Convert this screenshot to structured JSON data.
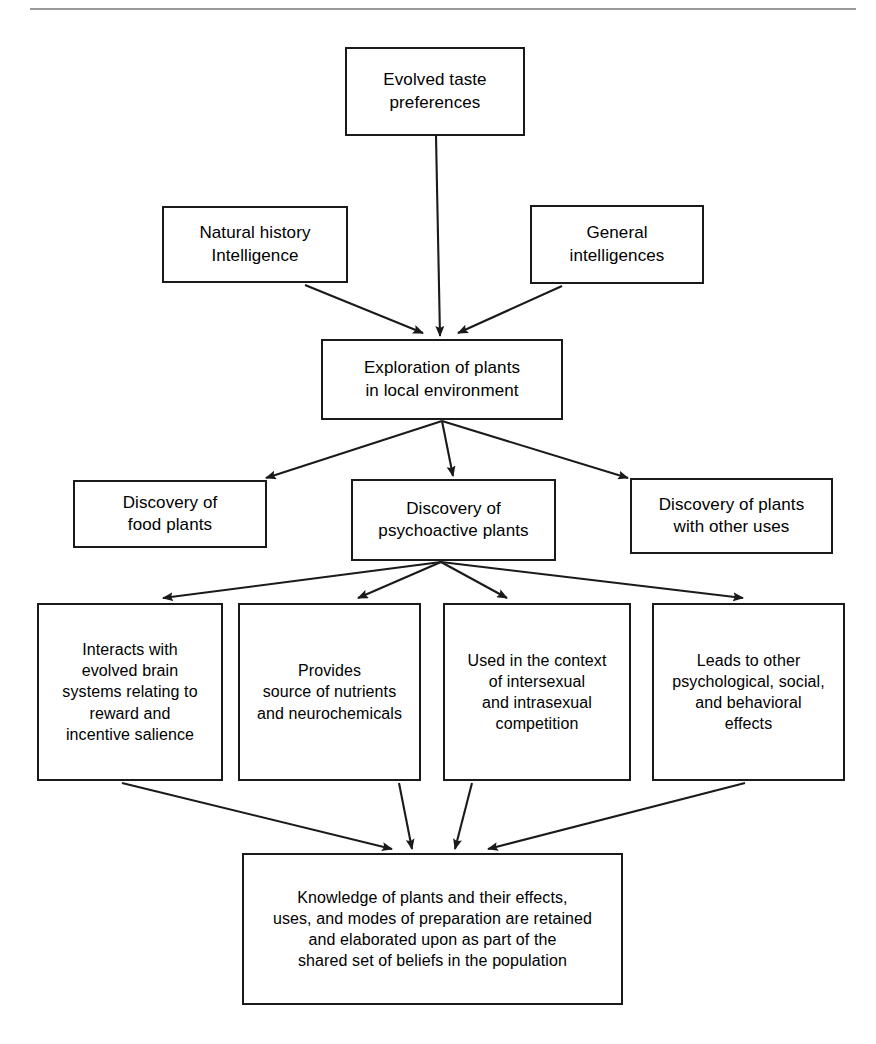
{
  "page": {
    "width": 876,
    "height": 1044,
    "background_color": "#ffffff",
    "line_color": "#1a1a1a",
    "top_rule_color": "#9a9a9a"
  },
  "diagram": {
    "type": "flowchart",
    "title": "",
    "nodes": [
      {
        "id": "evolved-taste-preferences",
        "label": "Evolved taste\npreferences",
        "x": 345,
        "y": 47,
        "w": 180,
        "h": 89,
        "font_size": 17
      },
      {
        "id": "natural-history-intelligence",
        "label": "Natural history\nIntelligence",
        "x": 162,
        "y": 206,
        "w": 186,
        "h": 77,
        "font_size": 17
      },
      {
        "id": "general-intelligences",
        "label": "General\nintelligences",
        "x": 530,
        "y": 205,
        "w": 174,
        "h": 79,
        "font_size": 17
      },
      {
        "id": "exploration-of-plants",
        "label": "Exploration of plants\nin local environment",
        "x": 321,
        "y": 339,
        "w": 242,
        "h": 81,
        "font_size": 17
      },
      {
        "id": "discovery-of-food-plants",
        "label": "Discovery of\nfood plants",
        "x": 73,
        "y": 480,
        "w": 194,
        "h": 68,
        "font_size": 17
      },
      {
        "id": "discovery-of-psychoactive-plants",
        "label": "Discovery of\npsychoactive plants",
        "x": 351,
        "y": 479,
        "w": 205,
        "h": 82,
        "font_size": 17
      },
      {
        "id": "discovery-of-plants-other-uses",
        "label": "Discovery of plants\nwith other uses",
        "x": 630,
        "y": 478,
        "w": 203,
        "h": 76,
        "font_size": 17
      },
      {
        "id": "interacts-with-evolved-brain-systems",
        "label": "Interacts with\nevolved brain\nsystems relating to\nreward and\nincentive salience",
        "x": 37,
        "y": 603,
        "w": 186,
        "h": 178,
        "font_size": 16
      },
      {
        "id": "provides-source-of-nutrients",
        "label": "Provides\nsource of nutrients\nand neurochemicals",
        "x": 238,
        "y": 603,
        "w": 183,
        "h": 178,
        "font_size": 16
      },
      {
        "id": "used-in-context-of-competition",
        "label": "Used in the context\nof intersexual\nand intrasexual\ncompetition",
        "x": 443,
        "y": 603,
        "w": 188,
        "h": 178,
        "font_size": 16
      },
      {
        "id": "leads-to-other-effects",
        "label": "Leads to other\npsychological, social,\nand behavioral\neffects",
        "x": 652,
        "y": 603,
        "w": 193,
        "h": 178,
        "font_size": 16
      },
      {
        "id": "knowledge-of-plants-retained",
        "label": "Knowledge of plants and their effects,\nuses, and modes of preparation are retained\nand elaborated upon as part of the\nshared set of beliefs in the population",
        "x": 242,
        "y": 853,
        "w": 381,
        "h": 152,
        "font_size": 16
      }
    ],
    "edges": [
      {
        "id": "edge-taste-to-exploration",
        "from": "evolved-taste-preferences",
        "to": "exploration-of-plants",
        "x1": 436,
        "y1": 136,
        "x2": 440,
        "y2": 336
      },
      {
        "id": "edge-natural-history-to-exploration",
        "from": "natural-history-intelligence",
        "to": "exploration-of-plants",
        "x1": 305,
        "y1": 285,
        "x2": 423,
        "y2": 333
      },
      {
        "id": "edge-general-to-exploration",
        "from": "general-intelligences",
        "to": "exploration-of-plants",
        "x1": 562,
        "y1": 286,
        "x2": 458,
        "y2": 333
      },
      {
        "id": "edge-exploration-to-food-plants",
        "from": "exploration-of-plants",
        "to": "discovery-of-food-plants",
        "x1": 442,
        "y1": 421,
        "x2": 266,
        "y2": 478
      },
      {
        "id": "edge-exploration-to-psychoactive",
        "from": "exploration-of-plants",
        "to": "discovery-of-psychoactive-plants",
        "x1": 442,
        "y1": 421,
        "x2": 453,
        "y2": 476
      },
      {
        "id": "edge-exploration-to-other-uses",
        "from": "exploration-of-plants",
        "to": "discovery-of-plants-other-uses",
        "x1": 442,
        "y1": 421,
        "x2": 628,
        "y2": 478
      },
      {
        "id": "edge-psychoactive-to-interacts",
        "from": "discovery-of-psychoactive-plants",
        "to": "interacts-with-evolved-brain-systems",
        "x1": 441,
        "y1": 562,
        "x2": 163,
        "y2": 598
      },
      {
        "id": "edge-psychoactive-to-provides",
        "from": "discovery-of-psychoactive-plants",
        "to": "provides-source-of-nutrients",
        "x1": 441,
        "y1": 562,
        "x2": 358,
        "y2": 598
      },
      {
        "id": "edge-psychoactive-to-used-in-context",
        "from": "discovery-of-psychoactive-plants",
        "to": "used-in-context-of-competition",
        "x1": 441,
        "y1": 562,
        "x2": 507,
        "y2": 598
      },
      {
        "id": "edge-psychoactive-to-leads-to-other",
        "from": "discovery-of-psychoactive-plants",
        "to": "leads-to-other-effects",
        "x1": 441,
        "y1": 562,
        "x2": 743,
        "y2": 598
      },
      {
        "id": "edge-interacts-to-knowledge",
        "from": "interacts-with-evolved-brain-systems",
        "to": "knowledge-of-plants-retained",
        "x1": 122,
        "y1": 783,
        "x2": 392,
        "y2": 849
      },
      {
        "id": "edge-provides-to-knowledge",
        "from": "provides-source-of-nutrients",
        "to": "knowledge-of-plants-retained",
        "x1": 399,
        "y1": 783,
        "x2": 412,
        "y2": 849
      },
      {
        "id": "edge-used-in-context-to-knowledge",
        "from": "used-in-context-of-competition",
        "to": "knowledge-of-plants-retained",
        "x1": 472,
        "y1": 783,
        "x2": 455,
        "y2": 849
      },
      {
        "id": "edge-leads-to-other-to-knowledge",
        "from": "leads-to-other-effects",
        "to": "knowledge-of-plants-retained",
        "x1": 745,
        "y1": 783,
        "x2": 488,
        "y2": 849
      }
    ],
    "top_rule": {
      "x": 30,
      "y": 8,
      "w": 826
    }
  }
}
